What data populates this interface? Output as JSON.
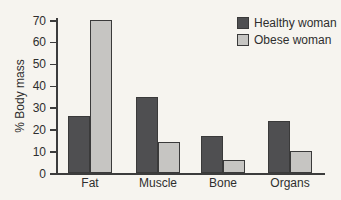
{
  "chart_data": {
    "type": "bar",
    "title": "",
    "xlabel": "",
    "ylabel": "% Body mass",
    "categories": [
      "Fat",
      "Muscle",
      "Bone",
      "Organs"
    ],
    "series": [
      {
        "name": "Healthy woman",
        "color": "#4f4f51",
        "values": [
          26,
          35,
          17,
          24
        ]
      },
      {
        "name": "Obese woman",
        "color": "#c6c5c2",
        "values": [
          70,
          14,
          6,
          10
        ]
      }
    ],
    "ylim": [
      0,
      70
    ],
    "yticks": [
      0,
      10,
      20,
      30,
      40,
      50,
      60,
      70
    ],
    "grid": false,
    "legend_position": "top-right",
    "colors": {
      "background": "#f6f4ef",
      "axis": "#3c3c3c",
      "bar_outline": "#3a3a3a",
      "text": "#2e2e2e"
    }
  }
}
